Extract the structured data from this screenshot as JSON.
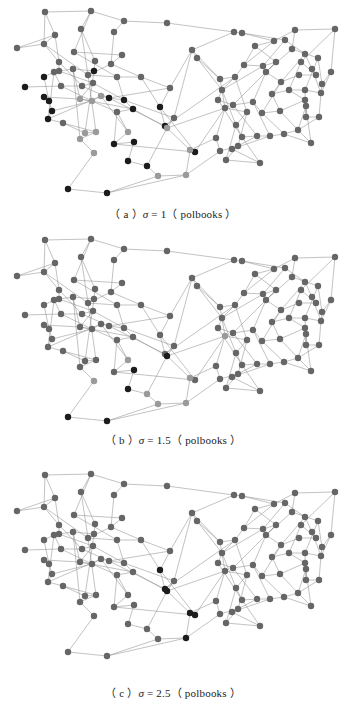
{
  "figure": {
    "dataset": "polbooks",
    "palette": {
      "d": "#1c1c1c",
      "m": "#666666",
      "l": "#9a9a9a",
      "edge": "#8a8a8a"
    },
    "nodes": [
      [
        45,
        12
      ],
      [
        91,
        11
      ],
      [
        124,
        21
      ],
      [
        167,
        23
      ],
      [
        234,
        32
      ],
      [
        17,
        48
      ],
      [
        44,
        44
      ],
      [
        55,
        35
      ],
      [
        81,
        29
      ],
      [
        114,
        32
      ],
      [
        74,
        52
      ],
      [
        122,
        55
      ],
      [
        59,
        62
      ],
      [
        95,
        61
      ],
      [
        111,
        64
      ],
      [
        59,
        71
      ],
      [
        94,
        71
      ],
      [
        88,
        75
      ],
      [
        73,
        69
      ],
      [
        44,
        77
      ],
      [
        54,
        72
      ],
      [
        117,
        77
      ],
      [
        141,
        77
      ],
      [
        25,
        87
      ],
      [
        61,
        86
      ],
      [
        82,
        86
      ],
      [
        93,
        83
      ],
      [
        170,
        88
      ],
      [
        44,
        97
      ],
      [
        49,
        101
      ],
      [
        52,
        111
      ],
      [
        48,
        119
      ],
      [
        63,
        123
      ],
      [
        80,
        99
      ],
      [
        92,
        101
      ],
      [
        101,
        96
      ],
      [
        109,
        98
      ],
      [
        124,
        100
      ],
      [
        133,
        109
      ],
      [
        117,
        112
      ],
      [
        160,
        107
      ],
      [
        85,
        133
      ],
      [
        96,
        132
      ],
      [
        80,
        139
      ],
      [
        128,
        132
      ],
      [
        165,
        126
      ],
      [
        174,
        118
      ],
      [
        167,
        128
      ],
      [
        114,
        144
      ],
      [
        134,
        142
      ],
      [
        94,
        153
      ],
      [
        128,
        161
      ],
      [
        147,
        166
      ],
      [
        158,
        176
      ],
      [
        195,
        152
      ],
      [
        190,
        150
      ],
      [
        68,
        189
      ],
      [
        107,
        193
      ],
      [
        186,
        175
      ],
      [
        192,
        50
      ],
      [
        197,
        58
      ],
      [
        242,
        33
      ],
      [
        335,
        29
      ],
      [
        295,
        30
      ],
      [
        274,
        41
      ],
      [
        285,
        40
      ],
      [
        255,
        46
      ],
      [
        292,
        49
      ],
      [
        305,
        54
      ],
      [
        301,
        62
      ],
      [
        318,
        58
      ],
      [
        312,
        69
      ],
      [
        331,
        72
      ],
      [
        322,
        84
      ],
      [
        316,
        75
      ],
      [
        299,
        75
      ],
      [
        244,
        65
      ],
      [
        263,
        66
      ],
      [
        276,
        62
      ],
      [
        266,
        72
      ],
      [
        281,
        82
      ],
      [
        272,
        94
      ],
      [
        289,
        90
      ],
      [
        305,
        90
      ],
      [
        321,
        93
      ],
      [
        220,
        79
      ],
      [
        235,
        77
      ],
      [
        222,
        90
      ],
      [
        218,
        100
      ],
      [
        233,
        105
      ],
      [
        253,
        102
      ],
      [
        262,
        113
      ],
      [
        280,
        111
      ],
      [
        305,
        100
      ],
      [
        306,
        106
      ],
      [
        306,
        117
      ],
      [
        319,
        117
      ],
      [
        225,
        108
      ],
      [
        247,
        112
      ],
      [
        236,
        125
      ],
      [
        242,
        137
      ],
      [
        257,
        136
      ],
      [
        270,
        136
      ],
      [
        284,
        134
      ],
      [
        298,
        130
      ],
      [
        311,
        143
      ],
      [
        216,
        138
      ],
      [
        220,
        151
      ],
      [
        238,
        146
      ],
      [
        226,
        160
      ],
      [
        260,
        163
      ],
      [
        232,
        149
      ]
    ],
    "edges": [
      [
        0,
        1
      ],
      [
        1,
        2
      ],
      [
        2,
        3
      ],
      [
        3,
        4
      ],
      [
        4,
        59
      ],
      [
        0,
        6
      ],
      [
        0,
        7
      ],
      [
        5,
        6
      ],
      [
        5,
        7
      ],
      [
        6,
        7
      ],
      [
        1,
        8
      ],
      [
        1,
        10
      ],
      [
        2,
        9
      ],
      [
        9,
        14
      ],
      [
        8,
        13
      ],
      [
        7,
        12
      ],
      [
        6,
        12
      ],
      [
        10,
        11
      ],
      [
        11,
        14
      ],
      [
        12,
        15
      ],
      [
        13,
        16
      ],
      [
        14,
        17
      ],
      [
        15,
        18
      ],
      [
        16,
        18
      ],
      [
        17,
        21
      ],
      [
        19,
        20
      ],
      [
        20,
        24
      ],
      [
        21,
        22
      ],
      [
        22,
        27
      ],
      [
        23,
        24
      ],
      [
        24,
        25
      ],
      [
        25,
        26
      ],
      [
        26,
        33
      ],
      [
        27,
        36
      ],
      [
        28,
        29
      ],
      [
        29,
        30
      ],
      [
        30,
        31
      ],
      [
        31,
        32
      ],
      [
        32,
        41
      ],
      [
        33,
        34
      ],
      [
        34,
        35
      ],
      [
        35,
        36
      ],
      [
        36,
        37
      ],
      [
        37,
        38
      ],
      [
        38,
        39
      ],
      [
        39,
        44
      ],
      [
        40,
        45
      ],
      [
        41,
        42
      ],
      [
        42,
        43
      ],
      [
        43,
        50
      ],
      [
        44,
        48
      ],
      [
        45,
        46
      ],
      [
        46,
        47
      ],
      [
        47,
        52
      ],
      [
        48,
        49
      ],
      [
        49,
        51
      ],
      [
        50,
        56
      ],
      [
        51,
        52
      ],
      [
        52,
        53
      ],
      [
        53,
        57
      ],
      [
        56,
        57
      ],
      [
        54,
        55
      ],
      [
        55,
        58
      ],
      [
        58,
        53
      ],
      [
        22,
        40
      ],
      [
        27,
        40
      ],
      [
        40,
        54
      ],
      [
        45,
        55
      ],
      [
        46,
        59
      ],
      [
        59,
        60
      ],
      [
        60,
        87
      ],
      [
        27,
        59
      ],
      [
        61,
        64
      ],
      [
        61,
        65
      ],
      [
        62,
        63
      ],
      [
        62,
        69
      ],
      [
        62,
        72
      ],
      [
        63,
        67
      ],
      [
        63,
        64
      ],
      [
        64,
        66
      ],
      [
        65,
        68
      ],
      [
        66,
        76
      ],
      [
        67,
        70
      ],
      [
        68,
        71
      ],
      [
        69,
        74
      ],
      [
        70,
        73
      ],
      [
        71,
        74
      ],
      [
        72,
        73
      ],
      [
        73,
        84
      ],
      [
        74,
        75
      ],
      [
        75,
        80
      ],
      [
        76,
        77
      ],
      [
        77,
        78
      ],
      [
        78,
        79
      ],
      [
        79,
        80
      ],
      [
        80,
        81
      ],
      [
        81,
        82
      ],
      [
        82,
        83
      ],
      [
        83,
        84
      ],
      [
        84,
        96
      ],
      [
        85,
        86
      ],
      [
        86,
        87
      ],
      [
        87,
        88
      ],
      [
        88,
        89
      ],
      [
        89,
        90
      ],
      [
        90,
        91
      ],
      [
        91,
        92
      ],
      [
        92,
        93
      ],
      [
        93,
        94
      ],
      [
        94,
        95
      ],
      [
        95,
        96
      ],
      [
        96,
        104
      ],
      [
        97,
        98
      ],
      [
        98,
        99
      ],
      [
        99,
        100
      ],
      [
        100,
        101
      ],
      [
        101,
        102
      ],
      [
        102,
        103
      ],
      [
        103,
        104
      ],
      [
        104,
        105
      ],
      [
        106,
        107
      ],
      [
        107,
        108
      ],
      [
        108,
        109
      ],
      [
        109,
        110
      ],
      [
        110,
        111
      ],
      [
        112,
        110
      ],
      [
        60,
        85
      ],
      [
        54,
        97
      ],
      [
        55,
        106
      ],
      [
        58,
        107
      ],
      [
        47,
        97
      ],
      [
        48,
        54
      ],
      [
        45,
        86
      ],
      [
        4,
        61
      ],
      [
        59,
        85
      ],
      [
        57,
        58
      ],
      [
        6,
        17
      ],
      [
        8,
        17
      ],
      [
        10,
        21
      ],
      [
        12,
        25
      ],
      [
        15,
        26
      ],
      [
        18,
        33
      ],
      [
        21,
        37
      ],
      [
        14,
        22
      ],
      [
        24,
        34
      ],
      [
        25,
        36
      ],
      [
        26,
        37
      ],
      [
        33,
        38
      ],
      [
        34,
        39
      ],
      [
        35,
        44
      ],
      [
        16,
        41
      ],
      [
        17,
        42
      ],
      [
        18,
        43
      ],
      [
        20,
        31
      ],
      [
        19,
        29
      ],
      [
        28,
        33
      ],
      [
        30,
        34
      ],
      [
        31,
        35
      ],
      [
        32,
        42
      ],
      [
        36,
        45
      ],
      [
        37,
        46
      ],
      [
        38,
        47
      ],
      [
        39,
        48
      ],
      [
        64,
        76
      ],
      [
        65,
        77
      ],
      [
        66,
        78
      ],
      [
        67,
        79
      ],
      [
        68,
        80
      ],
      [
        69,
        82
      ],
      [
        70,
        83
      ],
      [
        71,
        84
      ],
      [
        72,
        84
      ],
      [
        76,
        86
      ],
      [
        77,
        87
      ],
      [
        78,
        89
      ],
      [
        79,
        90
      ],
      [
        80,
        91
      ],
      [
        81,
        92
      ],
      [
        82,
        93
      ],
      [
        83,
        95
      ],
      [
        85,
        97
      ],
      [
        86,
        98
      ],
      [
        87,
        99
      ],
      [
        88,
        100
      ],
      [
        89,
        101
      ],
      [
        90,
        102
      ],
      [
        91,
        103
      ],
      [
        92,
        104
      ],
      [
        93,
        105
      ],
      [
        94,
        104
      ],
      [
        97,
        106
      ],
      [
        98,
        108
      ],
      [
        99,
        109
      ],
      [
        100,
        110
      ],
      [
        101,
        111
      ],
      [
        102,
        111
      ],
      [
        103,
        105
      ],
      [
        98,
        112
      ],
      [
        112,
        101
      ]
    ],
    "panels": [
      {
        "id": "a",
        "caption": {
          "prefix": "（ a ）",
          "symbol": "σ",
          "equals": " = 1",
          "suffix": "（ polbooks ）"
        },
        "dark": [
          16,
          19,
          23,
          28,
          29,
          30,
          31,
          36,
          37,
          38,
          40,
          45,
          48,
          49,
          51,
          52,
          54,
          56,
          57
        ],
        "light": [
          33,
          34,
          35,
          41,
          42,
          43,
          44,
          47,
          50,
          53,
          55,
          58
        ]
      },
      {
        "id": "b",
        "caption": {
          "prefix": "（ b ）",
          "symbol": "σ",
          "equals": " = 1.5",
          "suffix": "（ polbooks ）"
        },
        "dark": [
          47,
          49,
          51,
          56,
          57
        ],
        "light": [
          44,
          50,
          52,
          53,
          55,
          58,
          97
        ]
      },
      {
        "id": "c",
        "caption": {
          "prefix": "（ c ）",
          "symbol": "σ",
          "equals": " = 2.5",
          "suffix": "（ polbooks ）"
        },
        "dark": [
          40,
          45,
          47,
          55,
          54,
          58
        ],
        "light": []
      }
    ]
  }
}
